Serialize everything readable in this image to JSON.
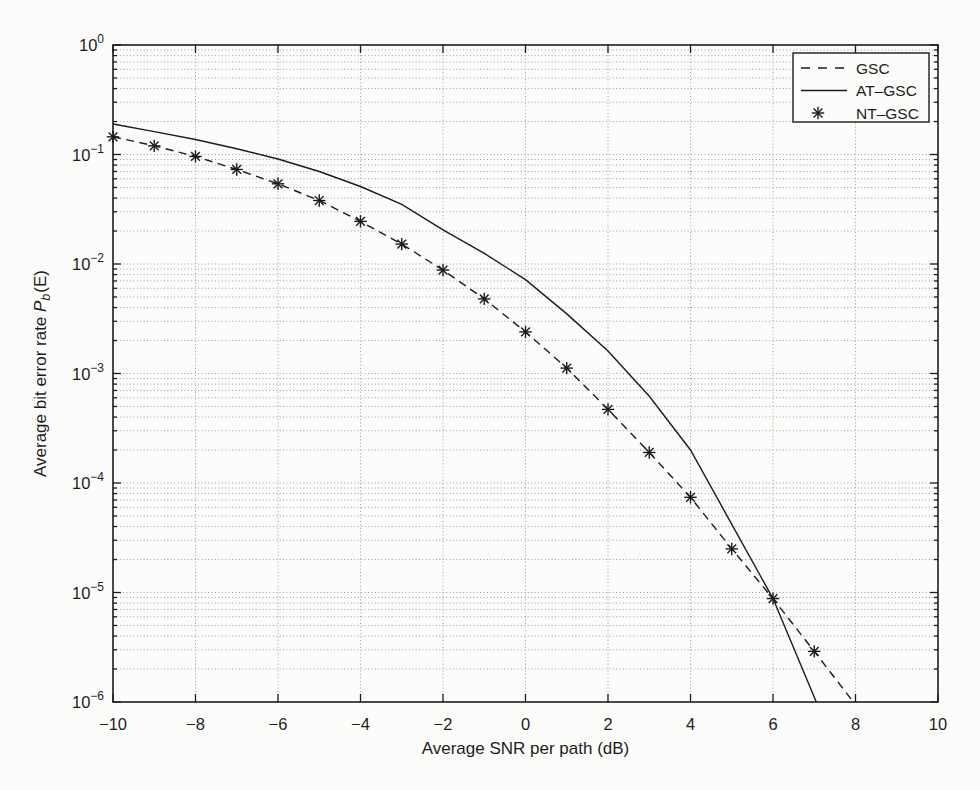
{
  "figure": {
    "background": "#fcfcfa",
    "ink_color": "#1c1c1c",
    "grid_color": "#a09e9a"
  },
  "chart_data": {
    "type": "line",
    "title": "",
    "xlabel": "Average SNR per path (dB)",
    "ylabel_parts": {
      "prefix": "Average bit error rate ",
      "symbol": "P",
      "subscript": "b",
      "suffix": "(E)"
    },
    "xlim": [
      -10,
      10
    ],
    "ylim": [
      1e-06,
      1
    ],
    "y_scale": "log",
    "grid": {
      "style": "dotted",
      "x_major": true,
      "y_major": true,
      "y_minor": true
    },
    "x_ticks": [
      -10,
      -8,
      -6,
      -4,
      -2,
      0,
      2,
      4,
      6,
      8,
      10
    ],
    "x_tick_labels": [
      "-10",
      "-8",
      "-6",
      "-4",
      "-2",
      "0",
      "2",
      "4",
      "6",
      "8",
      "10"
    ],
    "y_tick_exponents": [
      0,
      -1,
      -2,
      -3,
      -4,
      -5,
      -6
    ],
    "legend": {
      "position": "top-right",
      "entries": [
        {
          "label": "GSC",
          "sample": "dashed"
        },
        {
          "label": "AT-GSC",
          "sample": "solid"
        },
        {
          "label": "NT-GSC",
          "sample": "asterisk"
        }
      ]
    },
    "series": [
      {
        "name": "GSC",
        "style": "dashed",
        "color": "#1c1c1c",
        "x": [
          -10,
          -9,
          -8,
          -7,
          -6,
          -5,
          -4,
          -3,
          -2,
          -1,
          0,
          1,
          2,
          3,
          4,
          5,
          6,
          7,
          7.95
        ],
        "y": [
          0.145,
          0.12,
          0.096,
          0.073,
          0.054,
          0.038,
          0.0245,
          0.0152,
          0.0088,
          0.0048,
          0.0024,
          0.00112,
          0.00047,
          0.00019,
          7.4e-05,
          2.5e-05,
          8.8e-06,
          2.9e-06,
          1e-06
        ]
      },
      {
        "name": "AT-GSC",
        "style": "solid",
        "color": "#1c1c1c",
        "x": [
          -10,
          -9,
          -8,
          -7,
          -6,
          -5,
          -4,
          -3,
          -2,
          -1,
          0,
          1,
          2,
          3,
          4,
          5,
          6,
          7.05
        ],
        "y": [
          0.19,
          0.162,
          0.137,
          0.113,
          0.091,
          0.07,
          0.051,
          0.035,
          0.0205,
          0.0125,
          0.0072,
          0.0035,
          0.0016,
          0.00062,
          0.0002,
          4.2e-05,
          8.8e-06,
          1e-06
        ]
      },
      {
        "name": "NT-GSC",
        "style": "asterisk-markers",
        "color": "#1c1c1c",
        "x": [
          -10,
          -9,
          -8,
          -7,
          -6,
          -5,
          -4,
          -3,
          -2,
          -1,
          0,
          1,
          2,
          3,
          4,
          5,
          6,
          7
        ],
        "y": [
          0.145,
          0.12,
          0.096,
          0.073,
          0.054,
          0.038,
          0.0245,
          0.0152,
          0.0088,
          0.0048,
          0.0024,
          0.00112,
          0.00047,
          0.00019,
          7.4e-05,
          2.5e-05,
          8.8e-06,
          2.9e-06
        ]
      }
    ]
  }
}
